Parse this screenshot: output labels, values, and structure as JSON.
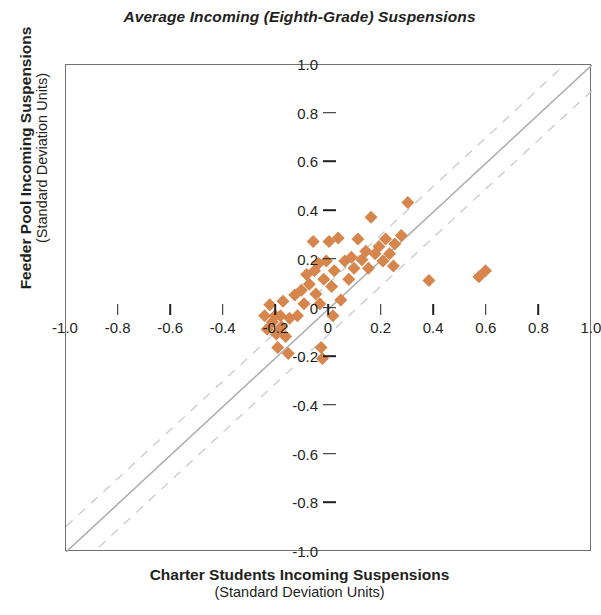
{
  "chart_data": {
    "type": "scatter",
    "title": "Average Incoming (Eighth-Grade) Suspensions",
    "xlabel": "Charter Students Incoming Suspensions",
    "xlabel_sub": "(Standard Deviation Units)",
    "ylabel": "Feeder Pool Incoming Suspensions",
    "ylabel_sub": "(Standard Deviation Units)",
    "xlim": [
      -1.0,
      1.0
    ],
    "ylim": [
      -1.0,
      1.0
    ],
    "grid": false,
    "legend": "none",
    "marker": "diamond",
    "marker_color": "#D6854C",
    "marker_size": 13,
    "xticks": [
      "-1.0",
      "-0.8",
      "-0.6",
      "-0.4",
      "-0.2",
      "0",
      "0.2",
      "0.4",
      "0.6",
      "0.8",
      "1.0"
    ],
    "xtick_values": [
      -1.0,
      -0.8,
      -0.6,
      -0.4,
      -0.2,
      0,
      0.2,
      0.4,
      0.6,
      0.8,
      1.0
    ],
    "yticks": [
      "1.0",
      "0.8",
      "0.6",
      "0.4",
      "0.2",
      "0",
      "-0.2",
      "-0.4",
      "-0.6",
      "-0.8",
      "-1.0"
    ],
    "ytick_values": [
      1.0,
      0.8,
      0.6,
      0.4,
      0.2,
      0,
      -0.2,
      -0.4,
      -0.6,
      -0.8,
      -1.0
    ],
    "reference_lines": [
      {
        "name": "identity-line",
        "type": "solid",
        "slope": 1,
        "intercept": 0,
        "color": "#a9abae"
      },
      {
        "name": "upper-band-line",
        "type": "dashed",
        "slope": 1,
        "intercept": 0.105,
        "color": "#c7cace"
      },
      {
        "name": "lower-band-line",
        "type": "dashed",
        "slope": 1,
        "intercept": -0.105,
        "color": "#c7cace"
      }
    ],
    "points": [
      {
        "x": -0.245,
        "y": -0.03
      },
      {
        "x": -0.235,
        "y": -0.085
      },
      {
        "x": -0.225,
        "y": 0.015
      },
      {
        "x": -0.215,
        "y": -0.055
      },
      {
        "x": -0.205,
        "y": -0.03
      },
      {
        "x": -0.2,
        "y": -0.105
      },
      {
        "x": -0.195,
        "y": -0.16
      },
      {
        "x": -0.185,
        "y": -0.03
      },
      {
        "x": -0.18,
        "y": -0.075
      },
      {
        "x": -0.175,
        "y": 0.03
      },
      {
        "x": -0.165,
        "y": -0.115
      },
      {
        "x": -0.155,
        "y": -0.185
      },
      {
        "x": -0.15,
        "y": -0.04
      },
      {
        "x": -0.13,
        "y": 0.055
      },
      {
        "x": -0.12,
        "y": -0.03
      },
      {
        "x": -0.105,
        "y": 0.075
      },
      {
        "x": -0.095,
        "y": 0.02
      },
      {
        "x": -0.085,
        "y": 0.14
      },
      {
        "x": -0.075,
        "y": 0.1
      },
      {
        "x": -0.06,
        "y": 0.275
      },
      {
        "x": -0.055,
        "y": 0.155
      },
      {
        "x": -0.05,
        "y": 0.06
      },
      {
        "x": -0.04,
        "y": 0.185
      },
      {
        "x": -0.035,
        "y": 0.02
      },
      {
        "x": -0.03,
        "y": -0.16
      },
      {
        "x": -0.025,
        "y": -0.205
      },
      {
        "x": -0.02,
        "y": 0.12
      },
      {
        "x": -0.01,
        "y": 0.195
      },
      {
        "x": 0.0,
        "y": 0.275
      },
      {
        "x": 0.01,
        "y": 0.09
      },
      {
        "x": 0.015,
        "y": -0.03
      },
      {
        "x": 0.02,
        "y": 0.155
      },
      {
        "x": 0.035,
        "y": 0.29
      },
      {
        "x": 0.045,
        "y": 0.035
      },
      {
        "x": 0.06,
        "y": 0.195
      },
      {
        "x": 0.075,
        "y": 0.12
      },
      {
        "x": 0.085,
        "y": 0.21
      },
      {
        "x": 0.095,
        "y": 0.165
      },
      {
        "x": 0.11,
        "y": 0.285
      },
      {
        "x": 0.125,
        "y": 0.2
      },
      {
        "x": 0.14,
        "y": 0.235
      },
      {
        "x": 0.15,
        "y": 0.165
      },
      {
        "x": 0.16,
        "y": 0.375
      },
      {
        "x": 0.175,
        "y": 0.225
      },
      {
        "x": 0.19,
        "y": 0.255
      },
      {
        "x": 0.205,
        "y": 0.195
      },
      {
        "x": 0.215,
        "y": 0.285
      },
      {
        "x": 0.23,
        "y": 0.225
      },
      {
        "x": 0.245,
        "y": 0.175
      },
      {
        "x": 0.25,
        "y": 0.265
      },
      {
        "x": 0.275,
        "y": 0.3
      },
      {
        "x": 0.3,
        "y": 0.435
      },
      {
        "x": 0.38,
        "y": 0.115
      },
      {
        "x": 0.57,
        "y": 0.13
      },
      {
        "x": 0.595,
        "y": 0.155
      }
    ]
  }
}
